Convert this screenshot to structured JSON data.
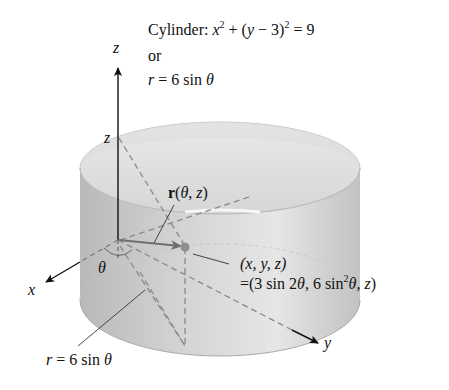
{
  "equation": {
    "prefix": "Cylinder: ",
    "cartesian_parts": [
      "x",
      "2",
      " + (",
      "y",
      " − 3)",
      "2",
      " = 9"
    ],
    "or": "or",
    "polar": {
      "r": "r",
      "eq": " = 6 sin ",
      "theta": "θ"
    }
  },
  "axes": {
    "x": "x",
    "y": "y",
    "z": "z"
  },
  "labels": {
    "z_height": "z",
    "theta": "θ",
    "r_vector": {
      "r": "r",
      "args_open": "(",
      "theta": "θ",
      "comma": ", ",
      "z": "z",
      "args_close": ")"
    },
    "point": {
      "line1": "(x, y, z)",
      "line2_parts": [
        "=(3 sin 2",
        "θ",
        ", 6 sin",
        "2",
        "θ",
        ", ",
        "z",
        ")"
      ]
    },
    "base_curve": {
      "r": "r",
      "eq": " = 6 sin ",
      "theta": "θ"
    }
  },
  "colors": {
    "cylinder_light": "#e2e2e2",
    "cylinder_dark": "#b4b4b4",
    "top_rim": "#d0d0d0",
    "dashed": "#8a8a8a",
    "vector": "#6f6f6f",
    "axis": "#111111"
  }
}
